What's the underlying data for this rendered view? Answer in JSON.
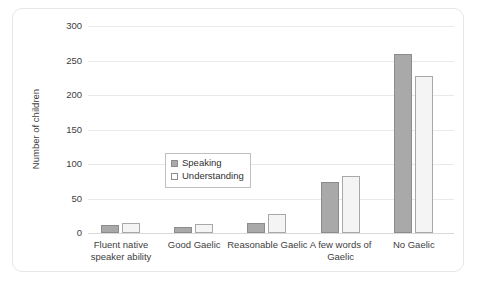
{
  "chart_data": {
    "type": "bar",
    "title": "",
    "xlabel": "",
    "ylabel": "Number of children",
    "ylim": [
      0,
      300
    ],
    "yticks": [
      0,
      50,
      100,
      150,
      200,
      250,
      300
    ],
    "ytick_labels": [
      "0",
      "50",
      "100",
      "150",
      "200",
      "250",
      "300"
    ],
    "grid": true,
    "legend_position": "inside-center-left",
    "categories": [
      "Fluent native speaker ability",
      "Good Gaelic",
      "Reasonable Gaelic",
      "A few words of Gaelic",
      "No Gaelic"
    ],
    "series": [
      {
        "name": "Speaking",
        "color": "#a9a9a9",
        "values": [
          12,
          8,
          15,
          74,
          260
        ]
      },
      {
        "name": "Understanding",
        "color": "#f4f4f4",
        "values": [
          15,
          13,
          27,
          83,
          228
        ]
      }
    ]
  },
  "figure": {
    "border_color": "#e6e6e6",
    "background": "#ffffff"
  }
}
